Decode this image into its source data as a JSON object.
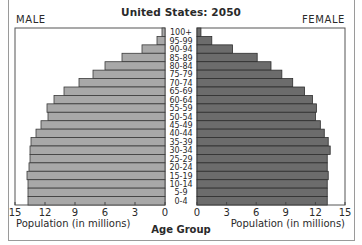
{
  "chart_data": {
    "type": "bar",
    "subtype": "population-pyramid",
    "title": "United States: 2050",
    "left_label": "MALE",
    "right_label": "FEMALE",
    "xlabel_left": "Population (in millions)",
    "xlabel_right": "Population (in millions)",
    "ylabel": "Age Group",
    "xlim": [
      0,
      15
    ],
    "xticks": [
      0,
      3,
      6,
      9,
      12,
      15
    ],
    "grid": false,
    "categories": [
      "100+",
      "95-99",
      "90-94",
      "85-89",
      "80-84",
      "75-79",
      "70-74",
      "65-69",
      "60-64",
      "55-59",
      "50-54",
      "45-49",
      "40-44",
      "35-39",
      "30-34",
      "25-29",
      "20-24",
      "15-19",
      "10-14",
      "5-9",
      "0-4"
    ],
    "series": [
      {
        "name": "Male",
        "color": "#a8a8a8",
        "values": [
          0.3,
          0.8,
          2.3,
          4.3,
          6.0,
          7.2,
          8.6,
          10.1,
          11.1,
          11.8,
          11.7,
          12.4,
          12.9,
          13.4,
          13.5,
          13.5,
          13.6,
          13.8,
          13.7,
          13.7,
          13.7
        ]
      },
      {
        "name": "Female",
        "color": "#6c6c6c",
        "values": [
          0.4,
          1.5,
          3.6,
          6.1,
          7.5,
          8.6,
          9.7,
          10.9,
          11.7,
          12.1,
          12.0,
          12.5,
          12.9,
          13.3,
          13.5,
          13.2,
          13.2,
          13.3,
          13.2,
          13.2,
          13.2
        ]
      }
    ]
  }
}
